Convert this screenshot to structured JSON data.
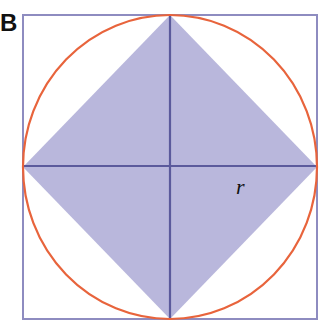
{
  "figure": {
    "panel_label": "B",
    "radius_label": "r",
    "colors": {
      "square_stroke": "#8e8cc0",
      "circle_stroke": "#e8643c",
      "diamond_fill": "#b9b7dc",
      "axis_lines": "#5b5a9c"
    },
    "shapes": [
      "square",
      "inscribed circle",
      "inscribed diamond (rotated square)",
      "horizontal diameter",
      "vertical diameter"
    ]
  }
}
